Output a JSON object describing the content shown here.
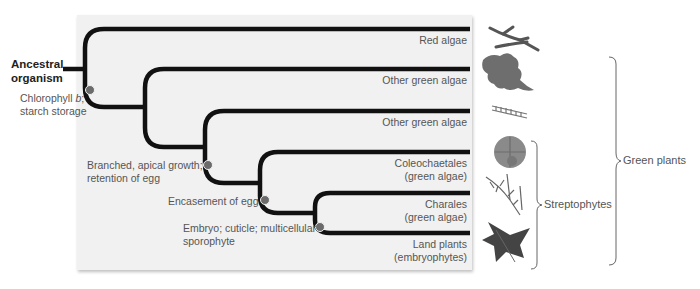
{
  "figure": {
    "root": {
      "line1": "Ancestral",
      "line2": "organism"
    },
    "taxa": [
      {
        "id": "red-algae",
        "line1": "Red algae",
        "line2": ""
      },
      {
        "id": "other-green-algae-1",
        "line1": "Other green algae",
        "line2": ""
      },
      {
        "id": "other-green-algae-2",
        "line1": "Other green algae",
        "line2": ""
      },
      {
        "id": "coleochaetales",
        "line1": "Coleochaetales",
        "line2": "(green algae)"
      },
      {
        "id": "charales",
        "line1": "Charales",
        "line2": "(green algae)"
      },
      {
        "id": "land-plants",
        "line1": "Land plants",
        "line2": "(embryophytes)"
      }
    ],
    "characters": [
      {
        "id": "chlorophyll",
        "line1": "Chlorophyll b;",
        "line2": "starch storage"
      },
      {
        "id": "branched",
        "line1": "Branched, apical growth;",
        "line2": "retention of egg"
      },
      {
        "id": "encasement",
        "line1": "Encasement of egg",
        "line2": ""
      },
      {
        "id": "embryo",
        "line1": "Embryo; cuticle; multicellular",
        "line2": "sporophyte"
      }
    ],
    "groups": [
      {
        "id": "streptophytes",
        "label": "Streptophytes"
      },
      {
        "id": "green-plants",
        "label": "Green plants"
      }
    ],
    "organism_icons": [
      "red-algae-seaweed-icon",
      "green-algae-lettuce-icon",
      "filamentous-algae-icon",
      "coleochaete-disk-icon",
      "chara-stonewort-icon",
      "fern-frond-icon"
    ],
    "colors": {
      "branch": "#111111",
      "node_dot": "#6b6b6b",
      "panel": "#f1f1f1",
      "label": "#555555",
      "bracket": "#666666"
    }
  }
}
